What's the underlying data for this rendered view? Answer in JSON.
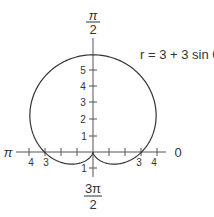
{
  "chart_data": {
    "type": "line",
    "coordinate_system": "polar",
    "title": "",
    "equation": "r = 3 + 3 sin θ",
    "curve": "cardioid",
    "series": [
      {
        "name": "r = 3 + 3 sin θ",
        "theta_deg": [
          0,
          30,
          60,
          90,
          120,
          150,
          180,
          210,
          240,
          270,
          300,
          330,
          360
        ],
        "r": [
          3,
          4.5,
          5.598,
          6,
          5.598,
          4.5,
          3,
          1.5,
          0.402,
          0,
          0.402,
          1.5,
          3
        ]
      }
    ],
    "angle_labels": {
      "top": {
        "numerator": "π",
        "denominator": "2"
      },
      "bottom": {
        "numerator": "3π",
        "denominator": "2"
      },
      "left": "π",
      "right": "0"
    },
    "vertical_axis_ticks": [
      "5",
      "4",
      "3",
      "2",
      "1"
    ],
    "vertical_axis_negative_ticks": [
      "1"
    ],
    "horizontal_axis_left_ticks": [
      "4",
      "3"
    ],
    "horizontal_axis_right_ticks": [
      "3",
      "4"
    ],
    "xlim": [
      -5,
      5
    ],
    "ylim": [
      -1.5,
      7
    ],
    "grid": false,
    "legend": "none"
  },
  "colors": {
    "curve": "#333333",
    "axes": "#555555",
    "text": "#333333"
  }
}
